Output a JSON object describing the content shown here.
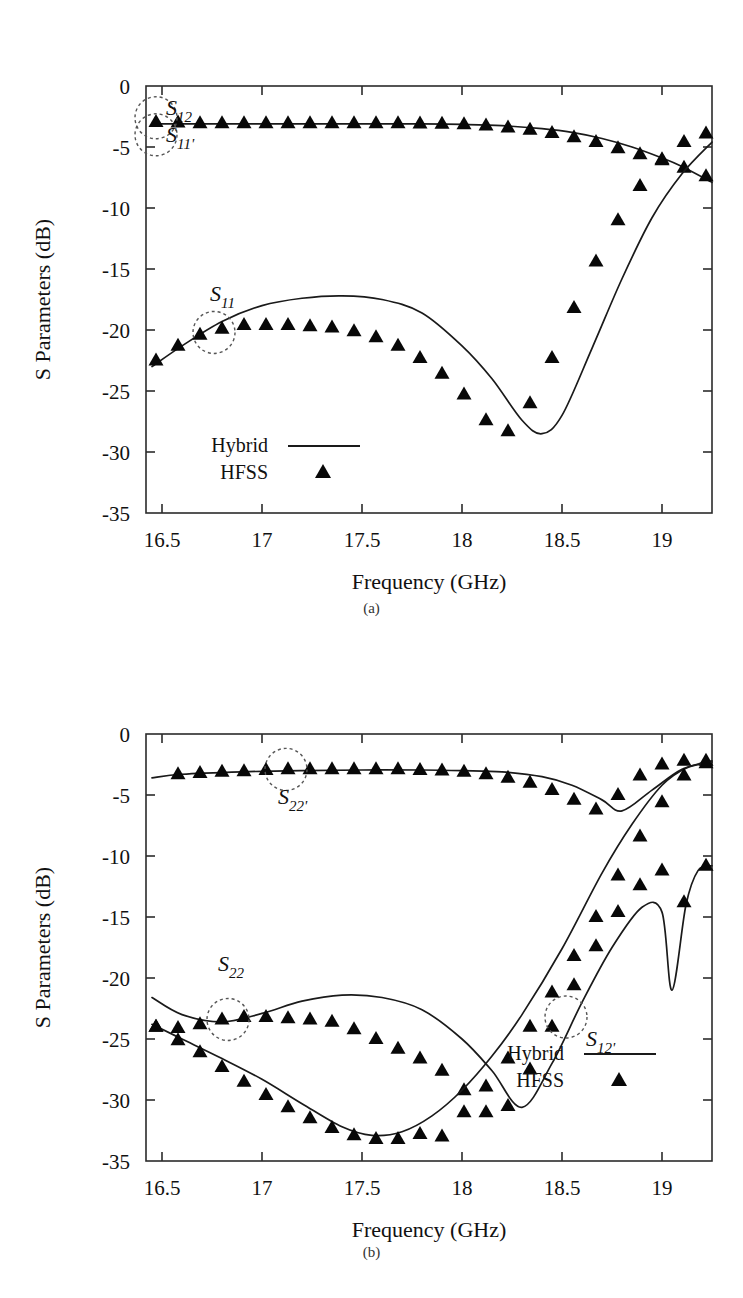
{
  "figure": {
    "ylabel": "S Parameters (dB)",
    "xlabel": "Frequency (GHz)",
    "caption_a": "(a)",
    "caption_b": "(b)",
    "legend": {
      "hybrid": "Hybrid",
      "hfss": "HFSS"
    },
    "line_color": "#1a1a1a",
    "marker_color": "#080808"
  },
  "chart_data": [
    {
      "type": "line",
      "panel": "(a)",
      "title": "",
      "xlabel": "Frequency (GHz)",
      "ylabel": "S Parameters (dB)",
      "xlim": [
        16.42,
        19.25
      ],
      "ylim": [
        -35,
        0
      ],
      "xticks": [
        16.5,
        17,
        17.5,
        18,
        18.5,
        19
      ],
      "xticklabels": [
        "16.5",
        "17",
        "17.5",
        "18",
        "18.5",
        "19"
      ],
      "yticks": [
        0,
        -5,
        -10,
        -15,
        -20,
        -25,
        -30,
        -35
      ],
      "yticklabels": [
        "0",
        "-5",
        "-10",
        "-15",
        "-20",
        "-25",
        "-30",
        "-35"
      ],
      "grid": false,
      "legend": [
        "Hybrid",
        "HFSS"
      ],
      "legend_position": "lower-left",
      "annotations": [
        {
          "label": "S12",
          "base": "S",
          "sub": "12",
          "x": 16.52,
          "y": -2.4,
          "circle_x": 16.47,
          "circle_y": -2.6
        },
        {
          "label": "S11'",
          "base": "S",
          "sub": "11'",
          "x": 16.52,
          "y": -4.6,
          "circle_x": 16.47,
          "circle_y": -4.0
        },
        {
          "label": "S11",
          "base": "S",
          "sub": "11",
          "x": 16.74,
          "y": -17.6,
          "circle_x": 16.76,
          "circle_y": -20.2
        }
      ],
      "series": [
        {
          "name": "S12 / S11' (Hybrid)",
          "style": "line",
          "x": [
            16.45,
            16.6,
            16.8,
            17.0,
            17.2,
            17.4,
            17.6,
            17.8,
            18.0,
            18.2,
            18.4,
            18.55,
            18.7,
            18.85,
            19.0,
            19.1,
            19.25
          ],
          "y": [
            -3.1,
            -3.1,
            -3.1,
            -3.1,
            -3.1,
            -3.1,
            -3.1,
            -3.1,
            -3.15,
            -3.25,
            -3.5,
            -3.8,
            -4.3,
            -5.0,
            -5.9,
            -6.6,
            -7.9
          ]
        },
        {
          "name": "S12 / S11' (HFSS markers)",
          "style": "markers",
          "x": [
            16.47,
            16.58,
            16.69,
            16.8,
            16.91,
            17.02,
            17.13,
            17.24,
            17.35,
            17.46,
            17.57,
            17.68,
            17.79,
            17.9,
            18.01,
            18.12,
            18.23,
            18.34,
            18.45,
            18.56,
            18.67,
            18.78,
            18.89,
            19.0,
            19.11,
            19.22
          ],
          "y": [
            -2.95,
            -3.0,
            -3.05,
            -3.05,
            -3.05,
            -3.05,
            -3.05,
            -3.05,
            -3.05,
            -3.05,
            -3.05,
            -3.05,
            -3.08,
            -3.1,
            -3.15,
            -3.25,
            -3.4,
            -3.6,
            -3.85,
            -4.2,
            -4.6,
            -5.1,
            -5.6,
            -6.1,
            -6.7,
            -7.4
          ]
        },
        {
          "name": "S11 (Hybrid)",
          "style": "line",
          "x": [
            16.45,
            16.6,
            16.8,
            17.0,
            17.2,
            17.4,
            17.6,
            17.8,
            18.0,
            18.15,
            18.3,
            18.4,
            18.5,
            18.65,
            18.8,
            18.95,
            19.1,
            19.25
          ],
          "y": [
            -23.0,
            -21.3,
            -19.3,
            -18.0,
            -17.4,
            -17.2,
            -17.5,
            -18.6,
            -21.3,
            -24.0,
            -27.4,
            -28.5,
            -27.0,
            -21.5,
            -15.8,
            -10.8,
            -7.2,
            -4.6
          ]
        },
        {
          "name": "S11 (HFSS markers)",
          "style": "markers",
          "x": [
            16.47,
            16.58,
            16.69,
            16.8,
            16.91,
            17.02,
            17.13,
            17.24,
            17.35,
            17.46,
            17.57,
            17.68,
            17.79,
            17.9,
            18.01,
            18.12,
            18.23,
            18.34,
            18.45,
            18.56,
            18.67,
            18.78,
            18.89,
            19.0,
            19.11,
            19.22
          ],
          "y": [
            -22.5,
            -21.3,
            -20.4,
            -19.9,
            -19.6,
            -19.6,
            -19.6,
            -19.7,
            -19.8,
            -20.1,
            -20.6,
            -21.3,
            -22.3,
            -23.6,
            -25.3,
            -27.4,
            -28.3,
            -26.0,
            -22.3,
            -18.2,
            -14.4,
            -11.0,
            -8.2,
            -6.0,
            -4.6,
            -3.9
          ]
        }
      ]
    },
    {
      "type": "line",
      "panel": "(b)",
      "title": "",
      "xlabel": "Frequency (GHz)",
      "ylabel": "S Parameters (dB)",
      "xlim": [
        16.42,
        19.25
      ],
      "ylim": [
        -35,
        0
      ],
      "xticks": [
        16.5,
        17,
        17.5,
        18,
        18.5,
        19
      ],
      "xticklabels": [
        "16.5",
        "17",
        "17.5",
        "18",
        "18.5",
        "19"
      ],
      "yticks": [
        0,
        -5,
        -10,
        -15,
        -20,
        -25,
        -30,
        -35
      ],
      "yticklabels": [
        "0",
        "-5",
        "-10",
        "-15",
        "-20",
        "-25",
        "-30",
        "-35"
      ],
      "grid": false,
      "legend": [
        "Hybrid",
        "HFSS"
      ],
      "legend_position": "lower-right",
      "annotations": [
        {
          "label": "S22'",
          "base": "S",
          "sub": "22'",
          "x": 17.08,
          "y": -5.7,
          "circle_x": 17.12,
          "circle_y": -2.9
        },
        {
          "label": "S22",
          "base": "S",
          "sub": "22",
          "x": 16.78,
          "y": -19.4,
          "circle_x": 16.83,
          "circle_y": -23.4
        },
        {
          "label": "S12'",
          "base": "S",
          "sub": "12'",
          "x": 18.62,
          "y": -25.6,
          "circle_x": 18.52,
          "circle_y": -23.2
        }
      ],
      "series": [
        {
          "name": "S22' (Hybrid)",
          "style": "line",
          "x": [
            16.45,
            16.6,
            16.9,
            17.2,
            17.5,
            17.8,
            18.0,
            18.2,
            18.4,
            18.55,
            18.7,
            18.8,
            18.95,
            19.1,
            19.25
          ],
          "y": [
            -3.6,
            -3.3,
            -3.1,
            -3.0,
            -2.95,
            -2.95,
            -3.0,
            -3.1,
            -3.5,
            -4.2,
            -5.4,
            -6.3,
            -4.6,
            -2.9,
            -2.2
          ]
        },
        {
          "name": "S22' (HFSS markers)",
          "style": "markers",
          "x": [
            16.58,
            16.69,
            16.8,
            16.91,
            17.02,
            17.13,
            17.24,
            17.35,
            17.46,
            17.57,
            17.68,
            17.79,
            17.9,
            18.01,
            18.12,
            18.23,
            18.34,
            18.45,
            18.56,
            18.67,
            18.78,
            18.89,
            19.0,
            19.11,
            19.22
          ],
          "y": [
            -3.3,
            -3.2,
            -3.1,
            -3.05,
            -2.95,
            -2.9,
            -2.9,
            -2.9,
            -2.9,
            -2.9,
            -2.9,
            -2.95,
            -3.0,
            -3.1,
            -3.3,
            -3.6,
            -4.0,
            -4.6,
            -5.4,
            -6.2,
            -5.0,
            -3.4,
            -2.5,
            -2.2,
            -2.2
          ]
        },
        {
          "name": "S22 (Hybrid)",
          "style": "line",
          "x": [
            16.45,
            16.6,
            16.8,
            17.0,
            17.2,
            17.4,
            17.6,
            17.8,
            18.0,
            18.15,
            18.3,
            18.45,
            18.6,
            18.75,
            18.9,
            19.0,
            19.05,
            19.12,
            19.18,
            19.25
          ],
          "y": [
            -21.6,
            -23.0,
            -23.6,
            -22.9,
            -21.9,
            -21.4,
            -21.6,
            -22.6,
            -25.0,
            -27.6,
            -30.6,
            -27.0,
            -22.0,
            -17.5,
            -14.2,
            -14.6,
            -21.0,
            -14.0,
            -11.2,
            -10.8
          ]
        },
        {
          "name": "S22 (HFSS markers)",
          "style": "markers",
          "x": [
            16.47,
            16.58,
            16.69,
            16.8,
            16.91,
            17.02,
            17.13,
            17.24,
            17.35,
            17.46,
            17.57,
            17.68,
            17.79,
            17.9,
            18.01,
            18.12,
            18.23,
            18.34,
            18.45,
            18.56,
            18.67,
            18.78,
            18.89,
            19.0,
            19.11,
            19.22
          ],
          "y": [
            -24.0,
            -24.1,
            -23.8,
            -23.4,
            -23.2,
            -23.2,
            -23.3,
            -23.4,
            -23.6,
            -24.2,
            -25.0,
            -25.8,
            -26.6,
            -27.6,
            -29.2,
            -31.0,
            -30.5,
            -27.5,
            -24.0,
            -20.6,
            -17.4,
            -14.6,
            -12.4,
            -11.2,
            -13.8,
            -10.8
          ]
        },
        {
          "name": "S12' (Hybrid)",
          "style": "line",
          "x": [
            16.45,
            16.6,
            16.8,
            17.0,
            17.2,
            17.4,
            17.55,
            17.7,
            17.85,
            18.0,
            18.15,
            18.3,
            18.5,
            18.7,
            18.85,
            19.0,
            19.12,
            19.25
          ],
          "y": [
            -23.8,
            -25.0,
            -26.6,
            -28.3,
            -30.3,
            -32.2,
            -32.9,
            -32.6,
            -31.3,
            -29.2,
            -26.4,
            -23.0,
            -17.6,
            -11.4,
            -7.4,
            -4.2,
            -2.8,
            -2.3
          ]
        },
        {
          "name": "S12' (HFSS markers)",
          "style": "markers",
          "x": [
            16.47,
            16.58,
            16.69,
            16.8,
            16.91,
            17.02,
            17.13,
            17.24,
            17.35,
            17.46,
            17.57,
            17.68,
            17.79,
            17.9,
            18.01,
            18.12,
            18.23,
            18.34,
            18.45,
            18.56,
            18.67,
            18.78,
            18.89,
            19.0,
            19.11,
            19.22
          ],
          "y": [
            -24.0,
            -25.1,
            -26.1,
            -27.3,
            -28.5,
            -29.6,
            -30.6,
            -31.5,
            -32.3,
            -32.9,
            -33.2,
            -33.2,
            -32.8,
            -33.0,
            -31.0,
            -28.9,
            -26.6,
            -24.0,
            -21.2,
            -18.2,
            -15.0,
            -11.6,
            -8.4,
            -5.6,
            -3.4,
            -2.4
          ]
        }
      ]
    }
  ]
}
